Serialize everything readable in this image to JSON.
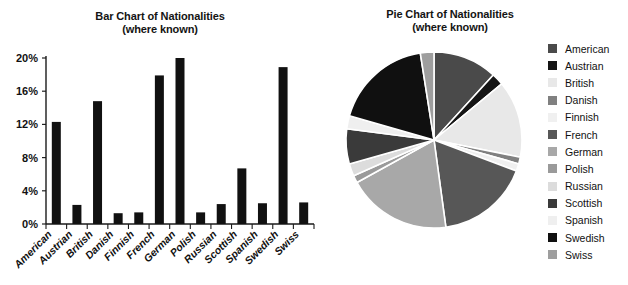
{
  "bar_chart": {
    "title_line1": "Bar Chart of Nationalities",
    "title_line2": "(where known)"
  },
  "pie_chart": {
    "title_line1": "Pie Chart  of Nationalities",
    "title_line2": "(where known)"
  },
  "legend": {
    "items": [
      {
        "label": "American",
        "color": "#4a4a4a"
      },
      {
        "label": "Austrian",
        "color": "#151515"
      },
      {
        "label": "British",
        "color": "#e8e8e8"
      },
      {
        "label": "Danish",
        "color": "#808080"
      },
      {
        "label": "Finnish",
        "color": "#f0f0f0"
      },
      {
        "label": "French",
        "color": "#575757"
      },
      {
        "label": "German",
        "color": "#a8a8a8"
      },
      {
        "label": "Polish",
        "color": "#9a9a9a"
      },
      {
        "label": "Russian",
        "color": "#dcdcdc"
      },
      {
        "label": "Scottish",
        "color": "#3a3a3a"
      },
      {
        "label": "Spanish",
        "color": "#efefef"
      },
      {
        "label": "Swedish",
        "color": "#101010"
      },
      {
        "label": "Swiss",
        "color": "#9e9e9e"
      }
    ]
  },
  "chart_data": [
    {
      "type": "bar",
      "title": "Bar Chart of Nationalities (where known)",
      "xlabel": "",
      "ylabel": "",
      "ylim": [
        0,
        20
      ],
      "ytick_labels": [
        "0%",
        "4%",
        "8%",
        "12%",
        "16%",
        "20%"
      ],
      "ytick_values": [
        0,
        4,
        8,
        12,
        16,
        20
      ],
      "grid": false,
      "bar_color": "#111111",
      "categories": [
        "American",
        "Austrian",
        "British",
        "Danish",
        "Finnish",
        "French",
        "German",
        "Polish",
        "Russian",
        "Scottish",
        "Spanish",
        "Swedish",
        "Swiss"
      ],
      "values": [
        12.3,
        2.3,
        14.8,
        1.3,
        1.4,
        17.9,
        20.0,
        1.4,
        2.4,
        6.7,
        2.5,
        18.9,
        2.6
      ]
    },
    {
      "type": "pie",
      "title": "Pie Chart  of Nationalities (where known)",
      "legend_position": "right",
      "start_angle_deg": 0,
      "direction": "clockwise",
      "labels": [
        "American",
        "Austrian",
        "British",
        "Danish",
        "Finnish",
        "French",
        "German",
        "Polish",
        "Russian",
        "Scottish",
        "Spanish",
        "Swedish",
        "Swiss"
      ],
      "values": [
        12.3,
        2.3,
        14.8,
        1.3,
        1.4,
        17.9,
        20.0,
        1.4,
        2.4,
        6.7,
        2.5,
        18.9,
        2.6
      ],
      "colors": [
        "#4a4a4a",
        "#151515",
        "#e8e8e8",
        "#808080",
        "#f0f0f0",
        "#575757",
        "#a8a8a8",
        "#9a9a9a",
        "#dcdcdc",
        "#3a3a3a",
        "#efefef",
        "#101010",
        "#9e9e9e"
      ]
    }
  ]
}
